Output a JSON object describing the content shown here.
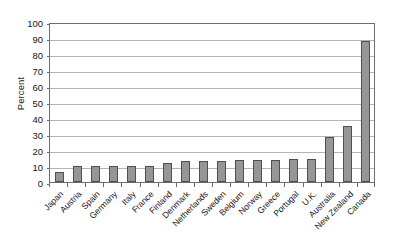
{
  "chart_data": {
    "type": "bar",
    "title": "",
    "xlabel": "",
    "ylabel": "Percent",
    "ylim": [
      0,
      100
    ],
    "ytick_step": 10,
    "yticks": [
      0,
      10,
      20,
      30,
      40,
      50,
      60,
      70,
      80,
      90,
      100
    ],
    "grid": true,
    "legend": "none",
    "bar_color": "#969696",
    "bar_edge_color": "#4f4f4f",
    "grid_color": "#b4b4b4",
    "axis_color": "#6e6e6e",
    "categories": [
      "Japan",
      "Austria",
      "Spain",
      "Germany",
      "Italy",
      "France",
      "Finland",
      "Denmark",
      "Netherlands",
      "Sweden",
      "Belgium",
      "Norway",
      "Greece",
      "Portugal",
      "U.K.",
      "Australia",
      "New Zealand",
      "Canada"
    ],
    "values": [
      6.5,
      10,
      10,
      10,
      10,
      10,
      12,
      13,
      13,
      13,
      13.5,
      13.5,
      14,
      14.5,
      14.5,
      28,
      35,
      88
    ]
  }
}
